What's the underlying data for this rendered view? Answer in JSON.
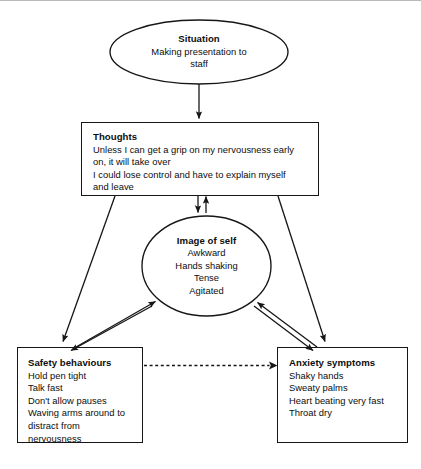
{
  "diagram": {
    "type": "flowchart",
    "accent_color": "#161616",
    "background_color": "#ffffff"
  },
  "nodes": {
    "situation": {
      "shape": "ellipse",
      "heading": "Situation",
      "lines": [
        "Making presentation to",
        "staff"
      ]
    },
    "thoughts": {
      "shape": "rectangle",
      "heading": "Thoughts",
      "lines": [
        "Unless I can get a grip on my nervousness early",
        "on, it will take over",
        "I could lose control and have to explain myself",
        "and leave"
      ]
    },
    "image_of_self": {
      "shape": "ellipse",
      "heading": "Image of self",
      "lines": [
        "Awkward",
        "Hands shaking",
        "Tense",
        "Agitated"
      ]
    },
    "safety_behaviours": {
      "shape": "rectangle",
      "heading": "Safety behaviours",
      "lines": [
        "Hold pen tight",
        "Talk fast",
        "Don't allow pauses",
        "Waving arms around to",
        "distract from",
        "nervousness"
      ]
    },
    "anxiety_symptoms": {
      "shape": "rectangle",
      "heading": "Anxiety symptoms",
      "lines": [
        "Shaky hands",
        "Sweaty palms",
        "Heart beating very fast",
        "Throat dry"
      ]
    }
  },
  "connectors": [
    {
      "name": "situation-to-thoughts",
      "from": "situation",
      "to": "thoughts",
      "style": "solid",
      "arrows": "one-way"
    },
    {
      "name": "thoughts-to-image",
      "from": "thoughts",
      "to": "image_of_self",
      "style": "solid",
      "arrows": "two-way"
    },
    {
      "name": "thoughts-to-safety",
      "from": "thoughts",
      "to": "safety_behaviours",
      "style": "solid",
      "arrows": "one-way"
    },
    {
      "name": "thoughts-to-anxiety",
      "from": "thoughts",
      "to": "anxiety_symptoms",
      "style": "solid",
      "arrows": "one-way"
    },
    {
      "name": "safety-to-image",
      "from": "safety_behaviours",
      "to": "image_of_self",
      "style": "solid",
      "arrows": "two-way"
    },
    {
      "name": "anxiety-to-image",
      "from": "anxiety_symptoms",
      "to": "image_of_self",
      "style": "solid",
      "arrows": "two-way"
    },
    {
      "name": "safety-to-anxiety",
      "from": "safety_behaviours",
      "to": "anxiety_symptoms",
      "style": "dashed",
      "arrows": "one-way"
    }
  ]
}
